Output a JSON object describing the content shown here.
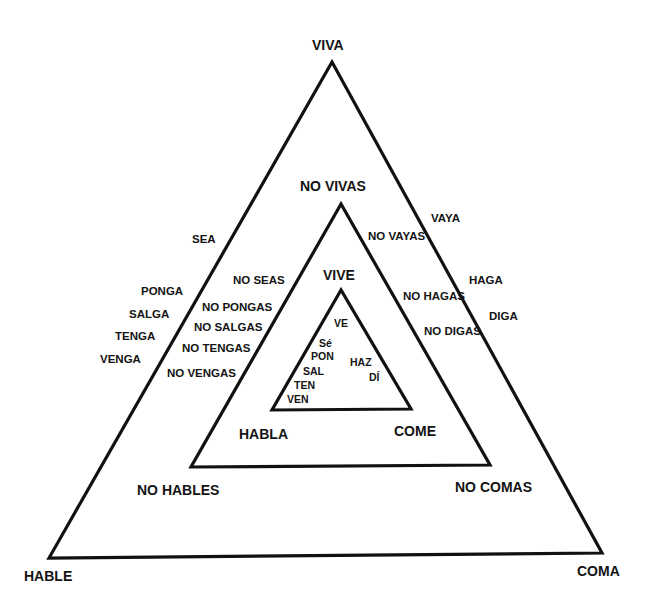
{
  "diagram": {
    "type": "nested-triangles",
    "line_color": "#111111",
    "outer_triangle": {
      "vertices": {
        "top": "VIVA",
        "bottom_left": "HABLE",
        "bottom_right": "COMA"
      },
      "left_side": [
        "SEA",
        "PONGA",
        "SALGA",
        "TENGA",
        "VENGA"
      ],
      "right_side": [
        "VAYA",
        "HAGA",
        "DIGA"
      ]
    },
    "middle_triangle": {
      "vertices": {
        "top": "NO VIVAS",
        "bottom_left": "NO HABLES",
        "bottom_right": "NO COMAS"
      },
      "left_side": [
        "NO SEAS",
        "NO PONGAS",
        "NO SALGAS",
        "NO TENGAS",
        "NO VENGAS"
      ],
      "right_side": [
        "NO VAYAS",
        "NO HAGAS",
        "NO DIGAS"
      ]
    },
    "inner_triangle": {
      "vertices": {
        "top": "VIVE",
        "bottom_left": "HABLA",
        "bottom_right": "COME"
      },
      "inside_top": "VE",
      "inside_left": [
        "Sé",
        "PON",
        "SAL",
        "TEN",
        "VEN"
      ],
      "inside_right": [
        "HAZ",
        "DÍ"
      ]
    }
  }
}
